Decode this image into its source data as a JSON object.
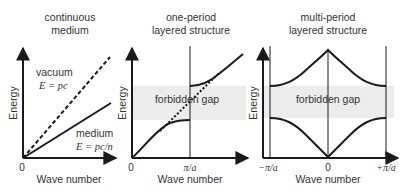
{
  "colors": {
    "line": "#1a1a1a",
    "text": "#333333",
    "gap_band": "#ececec"
  },
  "panels": [
    {
      "id": "continuous",
      "title_line1": "continuous",
      "title_line2": "medium",
      "ylabel": "Energy",
      "xlabel": "Wave number",
      "x_tick_origin": "0",
      "vacuum_label": "vacuum",
      "vacuum_eq": "E = pc",
      "medium_label": "medium",
      "medium_eq": "E = pc/n"
    },
    {
      "id": "one-period",
      "title_line1": "one-period",
      "title_line2": "layered structure",
      "ylabel": "Energy",
      "xlabel": "Wave number",
      "x_tick_origin": "0",
      "x_tick_boundary": "π/a",
      "gap_label": "forbidden gap"
    },
    {
      "id": "multi-period",
      "title_line1": "multi-period",
      "title_line2": "layered structure",
      "ylabel": "Energy",
      "xlabel": "Wave number",
      "x_tick_left": "−π/a",
      "x_tick_origin": "0",
      "x_tick_right": "+π/a",
      "gap_label": "forbidden gap"
    }
  ]
}
